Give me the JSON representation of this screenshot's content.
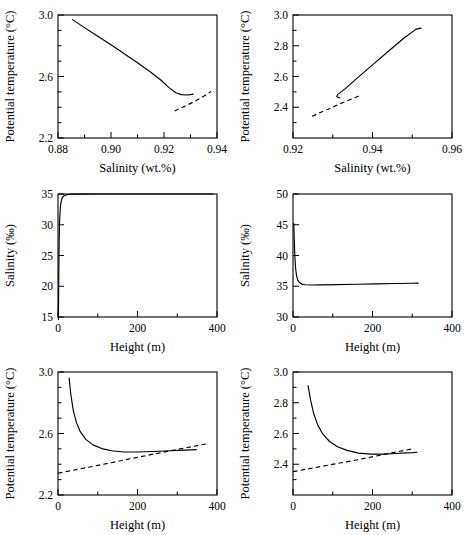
{
  "figure": {
    "title": "",
    "panel_count": 6,
    "layout": "2 columns x 3 rows"
  },
  "chart_data": [
    {
      "id": "panel-1",
      "position": "top-left",
      "type": "line",
      "title": "",
      "xlabel": "Salinity (wt.%)",
      "ylabel": "Potential temperature (°C)",
      "xlim": [
        0.88,
        0.94
      ],
      "ylim": [
        2.2,
        3.0
      ],
      "xticks": [
        0.88,
        0.9,
        0.92,
        0.94
      ],
      "xticklabels": [
        "0.88",
        "0.90",
        "0.92",
        "0.94"
      ],
      "yticks": [
        2.2,
        2.6,
        3.0
      ],
      "yticklabels": [
        "2.2",
        "2.6",
        "3.0"
      ],
      "minor_yticks": [
        2.3,
        2.4,
        2.5,
        2.7,
        2.8,
        2.9
      ],
      "minor_xticks": [
        0.89,
        0.91,
        0.93
      ],
      "grid": false,
      "legend": "none",
      "series": [
        {
          "name": "solid-curve",
          "style": "solid",
          "x": [
            0.8855,
            0.89,
            0.895,
            0.9,
            0.905,
            0.91,
            0.915,
            0.919,
            0.922,
            0.9245,
            0.9265,
            0.9285,
            0.93,
            0.931
          ],
          "y": [
            2.97,
            2.918,
            2.862,
            2.806,
            2.748,
            2.69,
            2.628,
            2.574,
            2.526,
            2.494,
            2.482,
            2.48,
            2.482,
            2.485
          ]
        },
        {
          "name": "dashed-line",
          "style": "dashed",
          "x": [
            0.924,
            0.928,
            0.932,
            0.936,
            0.9378
          ],
          "y": [
            2.376,
            2.408,
            2.442,
            2.482,
            2.503
          ]
        }
      ]
    },
    {
      "id": "panel-2",
      "position": "top-right",
      "type": "line",
      "title": "",
      "xlabel": "Salinity (wt.%)",
      "ylabel": "Potential temperature (°C)",
      "xlim": [
        0.92,
        0.96
      ],
      "ylim": [
        2.2,
        3.0
      ],
      "xticks": [
        0.92,
        0.94,
        0.96
      ],
      "xticklabels": [
        "0.92",
        "0.94",
        "0.96"
      ],
      "yticks": [
        2.4,
        2.6,
        2.8,
        3.0
      ],
      "yticklabels": [
        "2.4",
        "2.6",
        "2.8",
        "3.0"
      ],
      "minor_yticks": [
        2.3,
        2.5,
        2.7,
        2.9
      ],
      "minor_xticks": [
        0.93,
        0.95
      ],
      "grid": false,
      "legend": "none",
      "series": [
        {
          "name": "solid-curve",
          "style": "solid",
          "x": [
            0.9318,
            0.931,
            0.9312,
            0.933,
            0.936,
            0.94,
            0.944,
            0.948,
            0.951,
            0.9522
          ],
          "y": [
            2.46,
            2.468,
            2.482,
            2.518,
            2.586,
            2.676,
            2.764,
            2.852,
            2.908,
            2.915
          ]
        },
        {
          "name": "dashed-line",
          "style": "dashed",
          "x": [
            0.9248,
            0.928,
            0.932,
            0.9355,
            0.9372
          ],
          "y": [
            2.342,
            2.378,
            2.424,
            2.462,
            2.48
          ]
        }
      ]
    },
    {
      "id": "panel-3",
      "position": "middle-left",
      "type": "line",
      "title": "",
      "xlabel": "Height (m)",
      "ylabel": "Salinity (‰)",
      "xlim": [
        0,
        400
      ],
      "ylim": [
        15,
        35
      ],
      "xticks": [
        0,
        200,
        400
      ],
      "xticklabels": [
        "0",
        "200",
        "400"
      ],
      "yticks": [
        15,
        20,
        25,
        30,
        35
      ],
      "yticklabels": [
        "15",
        "20",
        "25",
        "30",
        "35"
      ],
      "minor_xticks": [
        100,
        300
      ],
      "grid": false,
      "legend": "none",
      "series": [
        {
          "name": "solid-curve",
          "style": "solid",
          "x": [
            1,
            2,
            3,
            4,
            6,
            8,
            11,
            15,
            20,
            28,
            40,
            60,
            100,
            160,
            220,
            280,
            340,
            390
          ],
          "y": [
            14.6,
            22.0,
            27.5,
            30.6,
            32.9,
            33.8,
            34.4,
            34.7,
            34.85,
            34.93,
            34.97,
            34.99,
            35.0,
            35.0,
            35.0,
            35.0,
            35.0,
            35.0
          ]
        }
      ]
    },
    {
      "id": "panel-4",
      "position": "middle-right",
      "type": "line",
      "title": "",
      "xlabel": "Height (m)",
      "ylabel": "Salinity (‰)",
      "xlim": [
        0,
        400
      ],
      "ylim": [
        30,
        50
      ],
      "xticks": [
        0,
        200,
        400
      ],
      "xticklabels": [
        "0",
        "200",
        "400"
      ],
      "yticks": [
        30,
        35,
        40,
        45,
        50
      ],
      "yticklabels": [
        "30",
        "35",
        "40",
        "45",
        "50"
      ],
      "minor_xticks": [
        100,
        300
      ],
      "grid": false,
      "legend": "none",
      "series": [
        {
          "name": "solid-curve",
          "style": "solid",
          "x": [
            2,
            3,
            4,
            5,
            7,
            9,
            12,
            16,
            22,
            30,
            45,
            70,
            110,
            160,
            210,
            260,
            300,
            315
          ],
          "y": [
            45.2,
            43.0,
            41.0,
            39.4,
            37.6,
            36.7,
            36.0,
            35.6,
            35.35,
            35.25,
            35.2,
            35.22,
            35.27,
            35.33,
            35.38,
            35.44,
            35.48,
            35.5
          ]
        }
      ]
    },
    {
      "id": "panel-5",
      "position": "bottom-left",
      "type": "line",
      "title": "",
      "xlabel": "Height (m)",
      "ylabel": "Potential temperature (°C)",
      "xlim": [
        0,
        400
      ],
      "ylim": [
        2.2,
        3.0
      ],
      "xticks": [
        0,
        200,
        400
      ],
      "xticklabels": [
        "0",
        "200",
        "400"
      ],
      "yticks": [
        2.2,
        2.6,
        3.0
      ],
      "yticklabels": [
        "2.2",
        "2.6",
        "3.0"
      ],
      "minor_yticks": [
        2.3,
        2.4,
        2.5,
        2.7,
        2.8,
        2.9
      ],
      "minor_xticks": [
        100,
        300
      ],
      "grid": false,
      "legend": "none",
      "series": [
        {
          "name": "solid-curve",
          "style": "solid",
          "x": [
            28,
            32,
            38,
            46,
            56,
            70,
            88,
            110,
            135,
            165,
            200,
            240,
            280,
            320,
            348
          ],
          "y": [
            2.96,
            2.86,
            2.756,
            2.674,
            2.612,
            2.562,
            2.526,
            2.502,
            2.488,
            2.48,
            2.48,
            2.483,
            2.488,
            2.492,
            2.495
          ]
        },
        {
          "name": "dashed-line",
          "style": "dashed",
          "x": [
            0,
            80,
            160,
            240,
            320,
            380
          ],
          "y": [
            2.342,
            2.382,
            2.424,
            2.466,
            2.506,
            2.536
          ]
        }
      ]
    },
    {
      "id": "panel-6",
      "position": "bottom-right",
      "type": "line",
      "title": "",
      "xlabel": "Height (m)",
      "ylabel": "Potential temperature (°C)",
      "xlim": [
        0,
        400
      ],
      "ylim": [
        2.2,
        3.0
      ],
      "xticks": [
        0,
        200,
        400
      ],
      "xticklabels": [
        "0",
        "200",
        "400"
      ],
      "yticks": [
        2.4,
        2.6,
        2.8,
        3.0
      ],
      "yticklabels": [
        "2.4",
        "2.6",
        "2.8",
        "3.0"
      ],
      "minor_yticks": [
        2.3,
        2.5,
        2.7,
        2.9
      ],
      "minor_xticks": [
        100,
        300
      ],
      "grid": false,
      "legend": "none",
      "series": [
        {
          "name": "solid-curve",
          "style": "solid",
          "x": [
            38,
            44,
            52,
            62,
            76,
            92,
            112,
            136,
            165,
            196,
            228,
            258,
            284,
            302,
            312
          ],
          "y": [
            2.912,
            2.82,
            2.73,
            2.656,
            2.592,
            2.548,
            2.514,
            2.49,
            2.472,
            2.466,
            2.466,
            2.47,
            2.474,
            2.476,
            2.478
          ]
        },
        {
          "name": "dashed-line",
          "style": "dashed",
          "x": [
            0,
            80,
            160,
            240,
            300
          ],
          "y": [
            2.352,
            2.39,
            2.428,
            2.47,
            2.5
          ]
        }
      ]
    }
  ]
}
